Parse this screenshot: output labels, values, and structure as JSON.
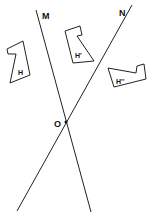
{
  "figure": {
    "lines": [
      {
        "name": "M",
        "label": "M"
      },
      {
        "name": "N",
        "label": "N"
      }
    ],
    "point": {
      "label": "O"
    },
    "shapes": [
      {
        "label": "H"
      },
      {
        "label": "H'"
      },
      {
        "label": "H''"
      }
    ]
  }
}
